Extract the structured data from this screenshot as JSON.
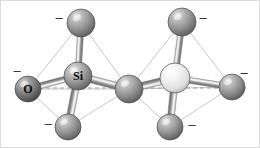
{
  "figure": {
    "name": "disilicate-ball-and-stick-diagram",
    "background_color": "#ffffff",
    "width": 260,
    "height": 148,
    "border_color": "#d8d8d8",
    "axis_line": {
      "name": "horizontal-dashed-axis",
      "color": "#9a9a9a",
      "dash": "4 3",
      "y": 88,
      "x1": 18,
      "x2": 246
    }
  },
  "labels": {
    "silicon": "Si",
    "oxygen": "O",
    "charge": "–"
  },
  "colors": {
    "silicon_dark": "#8d8d8d",
    "silicon_light": "#e4e4e4",
    "oxygen_dark": "#6e6e6e",
    "oxygen_mid": "#9a9a9a",
    "bond_color": "#8a8a8a",
    "edge_color": "#c2c2c2",
    "highlight": "#f2f2f2",
    "outline": "#4a4a4a",
    "text": "#0b0b0b"
  },
  "atoms": [
    {
      "id": "si-left",
      "name": "silicon-atom-left",
      "label": "Si",
      "cx": 78,
      "cy": 76,
      "r": 14,
      "shade": "silicon_dark",
      "label_dx": 0,
      "label_dy": 0,
      "font_size": 12
    },
    {
      "id": "si-right",
      "name": "silicon-atom-right",
      "label": "",
      "cx": 175,
      "cy": 78,
      "r": 15,
      "shade": "silicon_light",
      "label_dx": 0,
      "label_dy": 0,
      "font_size": 12
    },
    {
      "id": "o-terminal-left",
      "name": "oxygen-terminal-left",
      "label": "O",
      "cx": 28,
      "cy": 89,
      "r": 13,
      "shade": "oxygen_dark",
      "label_dx": 0,
      "label_dy": 0,
      "font_size": 12
    },
    {
      "id": "o-top-left",
      "name": "oxygen-terminal-top-left",
      "label": "",
      "cx": 81,
      "cy": 23,
      "r": 14,
      "shade": "oxygen_mid",
      "label_dx": 0,
      "label_dy": 0,
      "font_size": 11
    },
    {
      "id": "o-bottom-left",
      "name": "oxygen-terminal-bottom-left",
      "label": "",
      "cx": 68,
      "cy": 127,
      "r": 13,
      "shade": "oxygen_mid",
      "label_dx": 0,
      "label_dy": 0,
      "font_size": 11
    },
    {
      "id": "o-bridging",
      "name": "oxygen-bridging-center",
      "label": "",
      "cx": 129,
      "cy": 89,
      "r": 14,
      "shade": "oxygen_mid",
      "label_dx": 0,
      "label_dy": 0,
      "font_size": 11
    },
    {
      "id": "o-top-right",
      "name": "oxygen-terminal-top-right",
      "label": "",
      "cx": 182,
      "cy": 22,
      "r": 14,
      "shade": "oxygen_mid",
      "label_dx": 0,
      "label_dy": 0,
      "font_size": 11
    },
    {
      "id": "o-bottom-right",
      "name": "oxygen-terminal-bottom-right",
      "label": "",
      "cx": 170,
      "cy": 127,
      "r": 13,
      "shade": "oxygen_mid",
      "label_dx": 0,
      "label_dy": 0,
      "font_size": 11
    },
    {
      "id": "o-terminal-right",
      "name": "oxygen-terminal-right",
      "label": "",
      "cx": 232,
      "cy": 87,
      "r": 13,
      "shade": "oxygen_mid",
      "label_dx": 0,
      "label_dy": 0,
      "font_size": 11
    }
  ],
  "bonds": [
    {
      "name": "bond-si-left-to-oxygen-terminal-left",
      "from": "si-left",
      "to": "o-terminal-left",
      "width": 6
    },
    {
      "name": "bond-si-left-to-oxygen-top-left",
      "from": "si-left",
      "to": "o-top-left",
      "width": 6
    },
    {
      "name": "bond-si-left-to-oxygen-bottom-left",
      "from": "si-left",
      "to": "o-bottom-left",
      "width": 7
    },
    {
      "name": "bond-si-left-to-oxygen-bridging",
      "from": "si-left",
      "to": "o-bridging",
      "width": 7
    },
    {
      "name": "bond-si-right-to-oxygen-bridging",
      "from": "si-right",
      "to": "o-bridging",
      "width": 7
    },
    {
      "name": "bond-si-right-to-oxygen-top-right",
      "from": "si-right",
      "to": "o-top-right",
      "width": 6
    },
    {
      "name": "bond-si-right-to-oxygen-bottom-right",
      "from": "si-right",
      "to": "o-bottom-right",
      "width": 7
    },
    {
      "name": "bond-si-right-to-oxygen-terminal-right",
      "from": "si-right",
      "to": "o-terminal-right",
      "width": 6
    }
  ],
  "tetrahedron_edges": [
    {
      "name": "edge-left-top-to-terminal",
      "from": "o-top-left",
      "to": "o-terminal-left"
    },
    {
      "name": "edge-left-top-to-bridging",
      "from": "o-top-left",
      "to": "o-bridging"
    },
    {
      "name": "edge-left-top-to-bottom",
      "from": "o-top-left",
      "to": "o-bottom-left"
    },
    {
      "name": "edge-left-terminal-to-bottom",
      "from": "o-terminal-left",
      "to": "o-bottom-left"
    },
    {
      "name": "edge-left-terminal-to-bridging",
      "from": "o-terminal-left",
      "to": "o-bridging"
    },
    {
      "name": "edge-left-bottom-to-bridging",
      "from": "o-bottom-left",
      "to": "o-bridging"
    },
    {
      "name": "edge-right-top-to-bridging",
      "from": "o-top-right",
      "to": "o-bridging"
    },
    {
      "name": "edge-right-top-to-terminal",
      "from": "o-top-right",
      "to": "o-terminal-right"
    },
    {
      "name": "edge-right-top-to-bottom",
      "from": "o-top-right",
      "to": "o-bottom-right"
    },
    {
      "name": "edge-right-bridging-to-bottom",
      "from": "o-bridging",
      "to": "o-bottom-right"
    },
    {
      "name": "edge-right-bottom-to-terminal",
      "from": "o-bottom-right",
      "to": "o-terminal-right"
    },
    {
      "name": "edge-right-bridging-to-terminal",
      "from": "o-bridging",
      "to": "o-terminal-right"
    }
  ],
  "charges": [
    {
      "name": "charge-top-left",
      "text": "–",
      "x": 59,
      "y": 17,
      "font_size": 13
    },
    {
      "name": "charge-left",
      "text": "–",
      "x": 17,
      "y": 70,
      "font_size": 13
    },
    {
      "name": "charge-bottom-left",
      "text": "–",
      "x": 48,
      "y": 123,
      "font_size": 13
    },
    {
      "name": "charge-top-right",
      "text": "–",
      "x": 203,
      "y": 17,
      "font_size": 13
    },
    {
      "name": "charge-right",
      "text": "–",
      "x": 244,
      "y": 72,
      "font_size": 13
    },
    {
      "name": "charge-bottom-right",
      "text": "–",
      "x": 192,
      "y": 124,
      "font_size": 13
    }
  ]
}
